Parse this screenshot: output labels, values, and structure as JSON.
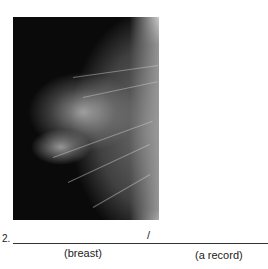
{
  "figure": {
    "image_description": "mammogram x-ray of breast tissue",
    "item_number": "2.",
    "separator": "/",
    "labels": [
      "(breast)",
      "(a record)"
    ]
  }
}
